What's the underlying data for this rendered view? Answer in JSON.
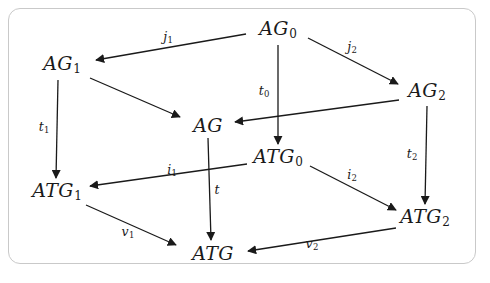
{
  "figure": {
    "kind": "commutative-cube-diagram",
    "frame_color": "#c9c9c9",
    "background_color": "#ffffff",
    "ink_color": "#1a1a1a"
  },
  "nodes": [
    {
      "id": "AG0",
      "base": "AG",
      "sub": "0",
      "x": 278,
      "y": 30
    },
    {
      "id": "AG1",
      "base": "AG",
      "sub": "1",
      "x": 62,
      "y": 65
    },
    {
      "id": "AG2",
      "base": "AG",
      "sub": "2",
      "x": 427,
      "y": 92
    },
    {
      "id": "AG",
      "base": "AG",
      "sub": "",
      "x": 208,
      "y": 125
    },
    {
      "id": "ATG0",
      "base": "ATG",
      "sub": "0",
      "x": 278,
      "y": 158
    },
    {
      "id": "ATG1",
      "base": "ATG",
      "sub": "1",
      "x": 57,
      "y": 192
    },
    {
      "id": "ATG2",
      "base": "ATG",
      "sub": "2",
      "x": 425,
      "y": 218
    },
    {
      "id": "ATG",
      "base": "ATG",
      "sub": "",
      "x": 213,
      "y": 253
    }
  ],
  "edges": [
    {
      "id": "j1",
      "base": "j",
      "sub": "1",
      "from": "AG0",
      "to": "AG1",
      "x1": 246,
      "y1": 34,
      "x2": 96,
      "y2": 60,
      "lx": 168,
      "ly": 38
    },
    {
      "id": "j2",
      "base": "j",
      "sub": "2",
      "from": "AG0",
      "to": "AG2",
      "x1": 308,
      "y1": 38,
      "x2": 398,
      "y2": 84,
      "lx": 352,
      "ly": 48
    },
    {
      "id": "e_ag1_ag",
      "base": "",
      "sub": "",
      "from": "AG1",
      "to": "AG",
      "x1": 90,
      "y1": 78,
      "x2": 180,
      "y2": 117,
      "lx": 0,
      "ly": 0
    },
    {
      "id": "e_ag2_ag",
      "base": "",
      "sub": "",
      "from": "AG2",
      "to": "AG",
      "x1": 399,
      "y1": 100,
      "x2": 235,
      "y2": 122,
      "lx": 0,
      "ly": 0
    },
    {
      "id": "t0",
      "base": "t",
      "sub": "0",
      "from": "AG0",
      "to": "ATG0",
      "x1": 278,
      "y1": 45,
      "x2": 278,
      "y2": 144,
      "lx": 264,
      "ly": 92
    },
    {
      "id": "t1",
      "base": "t",
      "sub": "1",
      "from": "AG1",
      "to": "ATG1",
      "x1": 58,
      "y1": 80,
      "x2": 56,
      "y2": 178,
      "lx": 44,
      "ly": 128
    },
    {
      "id": "t2",
      "base": "t",
      "sub": "2",
      "from": "AG2",
      "to": "ATG2",
      "x1": 427,
      "y1": 106,
      "x2": 425,
      "y2": 204,
      "lx": 412,
      "ly": 155
    },
    {
      "id": "t",
      "base": "t",
      "sub": "",
      "from": "AG",
      "to": "ATG",
      "x1": 208,
      "y1": 138,
      "x2": 211,
      "y2": 240,
      "lx": 217,
      "ly": 190
    },
    {
      "id": "i1",
      "base": "i",
      "sub": "1",
      "from": "ATG0",
      "to": "ATG1",
      "x1": 247,
      "y1": 164,
      "x2": 90,
      "y2": 186,
      "lx": 172,
      "ly": 171
    },
    {
      "id": "i2",
      "base": "i",
      "sub": "2",
      "from": "ATG0",
      "to": "ATG2",
      "x1": 310,
      "y1": 166,
      "x2": 396,
      "y2": 210,
      "lx": 352,
      "ly": 176
    },
    {
      "id": "v1",
      "base": "v",
      "sub": "1",
      "from": "ATG1",
      "to": "ATG",
      "x1": 86,
      "y1": 205,
      "x2": 176,
      "y2": 245,
      "lx": 128,
      "ly": 233
    },
    {
      "id": "v2",
      "base": "v",
      "sub": "2",
      "from": "ATG2",
      "to": "ATG",
      "x1": 396,
      "y1": 228,
      "x2": 248,
      "y2": 251,
      "lx": 312,
      "ly": 245
    }
  ]
}
